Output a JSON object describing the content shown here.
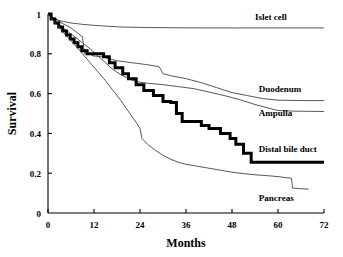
{
  "chart_data": {
    "type": "line",
    "title": "",
    "xlabel": "Months",
    "ylabel": "Survival",
    "xlim": [
      0,
      72
    ],
    "ylim": [
      0,
      1
    ],
    "grid": false,
    "legend_position": "inline-right-of-curves",
    "xticks": [
      "0",
      "12",
      "24",
      "36",
      "48",
      "60",
      "72"
    ],
    "xtick_values": [
      0,
      12,
      24,
      36,
      48,
      60,
      72
    ],
    "yticks": [
      "0",
      "0.2",
      "0.4",
      "0.6",
      "0.8",
      "1"
    ],
    "ytick_values": [
      0,
      0.2,
      0.4,
      0.6,
      0.8,
      1
    ],
    "series": [
      {
        "name": "Islet cell",
        "style": "thin",
        "label": "Islet cell",
        "label_x": 54,
        "label_y": 0.985,
        "points": [
          [
            0,
            1.0
          ],
          [
            1,
            0.985
          ],
          [
            2,
            0.972
          ],
          [
            4,
            0.962
          ],
          [
            6,
            0.955
          ],
          [
            9,
            0.948
          ],
          [
            12,
            0.943
          ],
          [
            16,
            0.938
          ],
          [
            20,
            0.934
          ],
          [
            26,
            0.932
          ],
          [
            32,
            0.931
          ],
          [
            40,
            0.93
          ],
          [
            50,
            0.93
          ],
          [
            60,
            0.93
          ],
          [
            72,
            0.93
          ]
        ]
      },
      {
        "name": "Duodenum",
        "style": "thin",
        "label": "Duodenum",
        "label_x": 55,
        "label_y": 0.625,
        "points": [
          [
            0,
            1.0
          ],
          [
            2,
            0.975
          ],
          [
            4,
            0.95
          ],
          [
            6,
            0.93
          ],
          [
            8,
            0.9
          ],
          [
            9,
            0.885
          ],
          [
            9.5,
            0.8
          ],
          [
            11,
            0.8
          ],
          [
            11.5,
            0.79
          ],
          [
            14,
            0.785
          ],
          [
            16,
            0.775
          ],
          [
            18,
            0.765
          ],
          [
            22,
            0.755
          ],
          [
            26,
            0.745
          ],
          [
            29,
            0.735
          ],
          [
            30,
            0.7
          ],
          [
            32,
            0.69
          ],
          [
            36,
            0.675
          ],
          [
            40,
            0.655
          ],
          [
            44,
            0.63
          ],
          [
            48,
            0.605
          ],
          [
            52,
            0.59
          ],
          [
            56,
            0.575
          ],
          [
            60,
            0.567
          ],
          [
            66,
            0.565
          ],
          [
            72,
            0.565
          ]
        ]
      },
      {
        "name": "Ampulla",
        "style": "thin",
        "label": "Ampulla",
        "label_x": 55,
        "label_y": 0.505,
        "points": [
          [
            0,
            1.0
          ],
          [
            1.5,
            0.97
          ],
          [
            3,
            0.945
          ],
          [
            5,
            0.915
          ],
          [
            7,
            0.885
          ],
          [
            9,
            0.855
          ],
          [
            11,
            0.825
          ],
          [
            13,
            0.79
          ],
          [
            15,
            0.755
          ],
          [
            17,
            0.72
          ],
          [
            19,
            0.695
          ],
          [
            21,
            0.675
          ],
          [
            23,
            0.66
          ],
          [
            26,
            0.652
          ],
          [
            30,
            0.645
          ],
          [
            34,
            0.635
          ],
          [
            38,
            0.625
          ],
          [
            42,
            0.608
          ],
          [
            46,
            0.59
          ],
          [
            50,
            0.57
          ],
          [
            54,
            0.545
          ],
          [
            58,
            0.525
          ],
          [
            60,
            0.515
          ],
          [
            64,
            0.512
          ],
          [
            72,
            0.51
          ]
        ]
      },
      {
        "name": "Distal bile duct",
        "style": "bold",
        "label": "Distal bile duct",
        "label_x": 55,
        "label_y": 0.32,
        "points": [
          [
            0,
            1.0
          ],
          [
            0.8,
            1.0
          ],
          [
            0.8,
            0.975
          ],
          [
            1.8,
            0.975
          ],
          [
            1.8,
            0.955
          ],
          [
            2.8,
            0.955
          ],
          [
            2.8,
            0.935
          ],
          [
            3.8,
            0.935
          ],
          [
            3.8,
            0.915
          ],
          [
            4.8,
            0.915
          ],
          [
            4.8,
            0.895
          ],
          [
            5.8,
            0.895
          ],
          [
            5.8,
            0.875
          ],
          [
            6.8,
            0.875
          ],
          [
            6.8,
            0.855
          ],
          [
            7.8,
            0.855
          ],
          [
            7.8,
            0.835
          ],
          [
            8.8,
            0.835
          ],
          [
            8.8,
            0.815
          ],
          [
            10.2,
            0.815
          ],
          [
            10.2,
            0.8
          ],
          [
            14.5,
            0.8
          ],
          [
            14.5,
            0.785
          ],
          [
            16,
            0.785
          ],
          [
            16,
            0.755
          ],
          [
            17.5,
            0.755
          ],
          [
            17.5,
            0.73
          ],
          [
            19.5,
            0.73
          ],
          [
            19.5,
            0.7
          ],
          [
            21,
            0.7
          ],
          [
            21,
            0.675
          ],
          [
            23,
            0.675
          ],
          [
            23,
            0.645
          ],
          [
            25,
            0.645
          ],
          [
            25,
            0.615
          ],
          [
            27.5,
            0.615
          ],
          [
            27.5,
            0.59
          ],
          [
            30,
            0.59
          ],
          [
            30,
            0.56
          ],
          [
            32,
            0.56
          ],
          [
            32,
            0.555
          ],
          [
            33.5,
            0.555
          ],
          [
            33.5,
            0.5
          ],
          [
            35,
            0.5
          ],
          [
            35,
            0.46
          ],
          [
            40,
            0.46
          ],
          [
            40,
            0.44
          ],
          [
            42,
            0.44
          ],
          [
            42,
            0.425
          ],
          [
            45,
            0.425
          ],
          [
            45,
            0.4
          ],
          [
            47.5,
            0.4
          ],
          [
            47.5,
            0.375
          ],
          [
            49,
            0.375
          ],
          [
            49,
            0.345
          ],
          [
            51,
            0.345
          ],
          [
            51,
            0.3
          ],
          [
            53,
            0.3
          ],
          [
            53,
            0.255
          ],
          [
            72,
            0.255
          ]
        ]
      },
      {
        "name": "Pancreas",
        "style": "thin",
        "label": "Pancreas",
        "label_x": 55,
        "label_y": 0.075,
        "points": [
          [
            0,
            1.0
          ],
          [
            1.5,
            0.965
          ],
          [
            3,
            0.93
          ],
          [
            5,
            0.885
          ],
          [
            7,
            0.845
          ],
          [
            9,
            0.8
          ],
          [
            11,
            0.755
          ],
          [
            13,
            0.71
          ],
          [
            15,
            0.665
          ],
          [
            17,
            0.615
          ],
          [
            19,
            0.565
          ],
          [
            21,
            0.51
          ],
          [
            23,
            0.455
          ],
          [
            24,
            0.425
          ],
          [
            24.5,
            0.375
          ],
          [
            26,
            0.345
          ],
          [
            28,
            0.315
          ],
          [
            30,
            0.29
          ],
          [
            32,
            0.27
          ],
          [
            34,
            0.255
          ],
          [
            36,
            0.245
          ],
          [
            39,
            0.235
          ],
          [
            42,
            0.225
          ],
          [
            45,
            0.215
          ],
          [
            48,
            0.205
          ],
          [
            51,
            0.198
          ],
          [
            54,
            0.192
          ],
          [
            57,
            0.188
          ],
          [
            60,
            0.183
          ],
          [
            62,
            0.178
          ],
          [
            63.5,
            0.175
          ],
          [
            63.8,
            0.125
          ],
          [
            66,
            0.122
          ],
          [
            68,
            0.12
          ]
        ]
      }
    ]
  }
}
